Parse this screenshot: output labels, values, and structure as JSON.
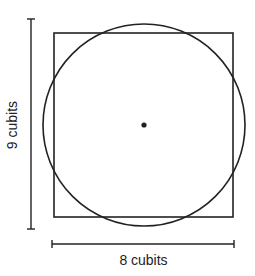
{
  "diagram": {
    "labels": {
      "height": "9 cubits",
      "width": "8 cubits"
    },
    "shapes": {
      "square": {
        "x": 54,
        "y": 33,
        "width": 179,
        "height": 184
      },
      "circle": {
        "cx": 144,
        "cy": 125,
        "r": 101
      },
      "center_dot": {
        "cx": 144,
        "cy": 125,
        "r": 3
      }
    },
    "dimension_lines": {
      "vertical": {
        "x": 31,
        "y1": 19,
        "y2": 229
      },
      "horizontal": {
        "y": 244,
        "x1": 52,
        "x2": 234
      }
    },
    "colors": {
      "stroke": "#222222",
      "background": "#ffffff"
    }
  }
}
